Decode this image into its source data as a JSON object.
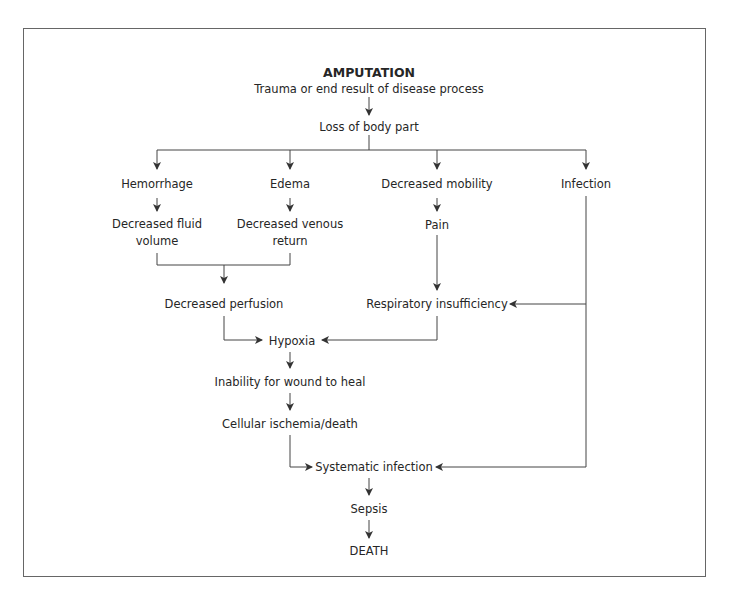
{
  "diagram": {
    "title": "AMPUTATION",
    "nodes": {
      "trauma": "Trauma or end result of disease process",
      "loss": "Loss of body part",
      "hemorrhage": "Hemorrhage",
      "edema": "Edema",
      "decreased_mobility": "Decreased mobility",
      "infection": "Infection",
      "decreased_fluid_volume_1": "Decreased fluid",
      "decreased_fluid_volume_2": "volume",
      "decreased_venous_return_1": "Decreased venous",
      "decreased_venous_return_2": "return",
      "pain": "Pain",
      "decreased_perfusion": "Decreased perfusion",
      "respiratory_insufficiency": "Respiratory insufficiency",
      "hypoxia": "Hypoxia",
      "inability_to_heal": "Inability for wound to heal",
      "cellular_ischemia": "Cellular ischemia/death",
      "systematic_infection": "Systematic infection",
      "sepsis": "Sepsis",
      "death": "DEATH"
    },
    "edges": [
      [
        "trauma",
        "loss"
      ],
      [
        "loss",
        "hemorrhage"
      ],
      [
        "loss",
        "edema"
      ],
      [
        "loss",
        "decreased_mobility"
      ],
      [
        "loss",
        "infection"
      ],
      [
        "hemorrhage",
        "decreased_fluid_volume"
      ],
      [
        "edema",
        "decreased_venous_return"
      ],
      [
        "decreased_mobility",
        "pain"
      ],
      [
        "decreased_fluid_volume",
        "decreased_perfusion"
      ],
      [
        "decreased_venous_return",
        "decreased_perfusion"
      ],
      [
        "pain",
        "respiratory_insufficiency"
      ],
      [
        "infection",
        "respiratory_insufficiency"
      ],
      [
        "decreased_perfusion",
        "hypoxia"
      ],
      [
        "respiratory_insufficiency",
        "hypoxia"
      ],
      [
        "hypoxia",
        "inability_to_heal"
      ],
      [
        "inability_to_heal",
        "cellular_ischemia"
      ],
      [
        "cellular_ischemia",
        "systematic_infection"
      ],
      [
        "infection",
        "systematic_infection"
      ],
      [
        "systematic_infection",
        "sepsis"
      ],
      [
        "sepsis",
        "death"
      ]
    ],
    "line_color": "#444444"
  }
}
